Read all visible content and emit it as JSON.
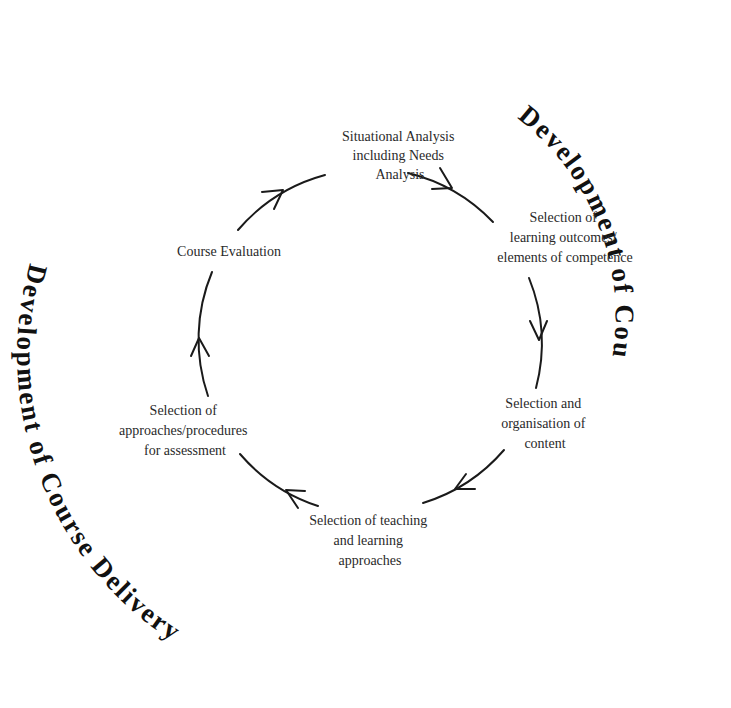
{
  "diagram": {
    "type": "cycle",
    "direction": "clockwise",
    "headings": {
      "courses": "Development of Courses",
      "delivery": "Development of Course Delivery"
    },
    "nodes": [
      {
        "id": "situational-analysis",
        "lines": [
          "Situational Analysis",
          "including Needs",
          "Analysis"
        ]
      },
      {
        "id": "learning-outcomes",
        "lines": [
          "Selection of",
          "learning outcomes/",
          "elements of competence"
        ]
      },
      {
        "id": "content",
        "lines": [
          "Selection and",
          "organisation of",
          "content"
        ]
      },
      {
        "id": "teaching-approaches",
        "lines": [
          "Selection of teaching",
          "and learning",
          "approaches"
        ]
      },
      {
        "id": "assessment",
        "lines": [
          "Selection of",
          "approaches/procedures",
          "for assessment"
        ]
      },
      {
        "id": "course-evaluation",
        "lines": [
          "Course Evaluation"
        ]
      }
    ],
    "edges": [
      {
        "from": "situational-analysis",
        "to": "learning-outcomes"
      },
      {
        "from": "learning-outcomes",
        "to": "content"
      },
      {
        "from": "content",
        "to": "teaching-approaches"
      },
      {
        "from": "teaching-approaches",
        "to": "assessment"
      },
      {
        "from": "assessment",
        "to": "course-evaluation"
      },
      {
        "from": "course-evaluation",
        "to": "situational-analysis"
      }
    ],
    "colors": {
      "background": "#ffffff",
      "stroke": "#1a1a1a",
      "text": "#2a2a2a",
      "heading": "#111111"
    }
  }
}
